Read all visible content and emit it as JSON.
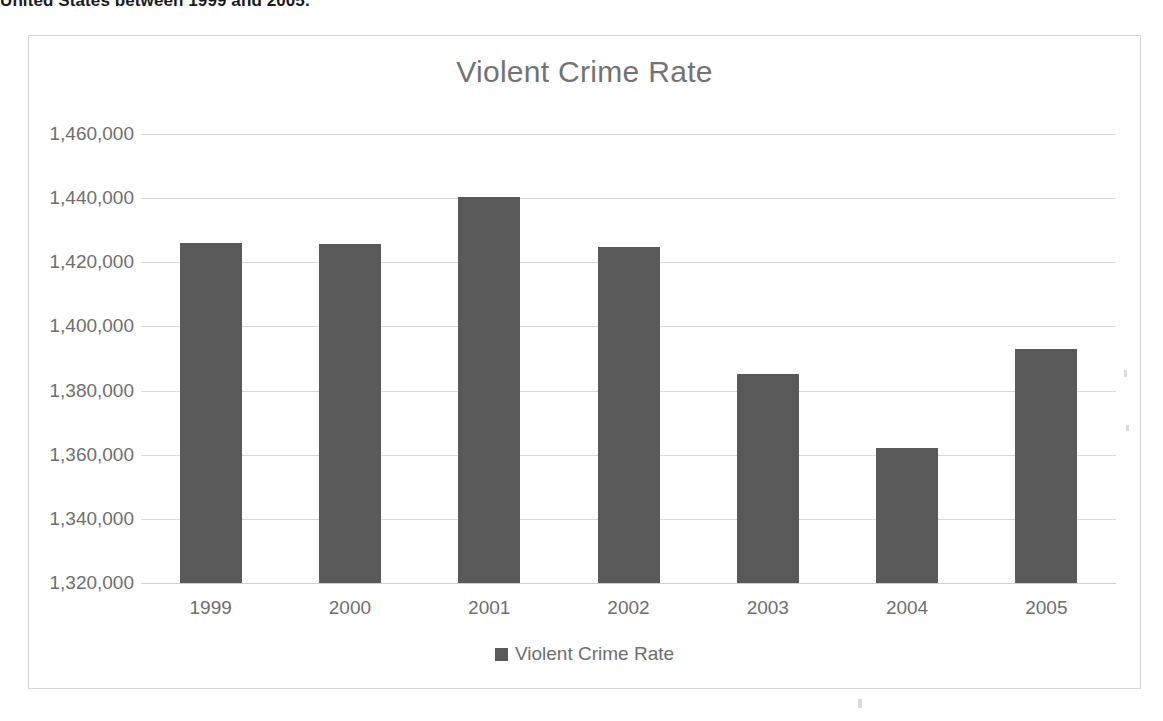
{
  "document": {
    "text_above_chart": "United States between 1999 and 2005.",
    "text_below_chart": ""
  },
  "chart": {
    "title": "Violent Crime Rate",
    "legend": {
      "position": "bottom",
      "entries": [
        {
          "label": "Violent Crime Rate",
          "color": "#595959"
        }
      ]
    },
    "colors": {
      "bar": "#595959",
      "gridline": "#d9d9d9",
      "text": "#6e6e6e",
      "border": "#d6d6d6"
    }
  },
  "chart_data": {
    "type": "bar",
    "title": "Violent Crime Rate",
    "xlabel": "",
    "ylabel": "",
    "categories": [
      "1999",
      "2000",
      "2001",
      "2002",
      "2003",
      "2004",
      "2005"
    ],
    "values": [
      1426000,
      1425800,
      1440400,
      1424800,
      1385200,
      1362000,
      1393000
    ],
    "series": [
      {
        "name": "Violent Crime Rate",
        "values": [
          1426000,
          1425800,
          1440400,
          1424800,
          1385200,
          1362000,
          1393000
        ]
      }
    ],
    "ylim": [
      1320000,
      1460000
    ],
    "ytick_labels": [
      "1,460,000",
      "1,440,000",
      "1,420,000",
      "1,400,000",
      "1,380,000",
      "1,360,000",
      "1,340,000",
      "1,320,000"
    ],
    "ytick_values": [
      1460000,
      1440000,
      1420000,
      1400000,
      1380000,
      1360000,
      1340000,
      1320000
    ],
    "grid": true,
    "legend_position": "bottom"
  }
}
